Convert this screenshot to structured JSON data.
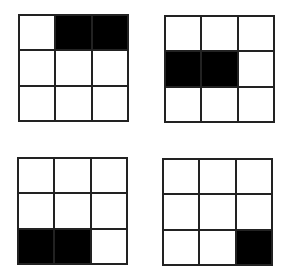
{
  "colors": {
    "filled": "#000000",
    "empty": "#ffffff",
    "line": "#222222"
  },
  "grids": [
    {
      "id": "grid-1",
      "position": "top-left",
      "rows": 3,
      "cols": 3,
      "cells": [
        [
          0,
          1,
          1
        ],
        [
          0,
          0,
          0
        ],
        [
          0,
          0,
          0
        ]
      ]
    },
    {
      "id": "grid-2",
      "position": "top-right",
      "rows": 3,
      "cols": 3,
      "cells": [
        [
          0,
          0,
          0
        ],
        [
          1,
          1,
          0
        ],
        [
          0,
          0,
          0
        ]
      ]
    },
    {
      "id": "grid-3",
      "position": "bottom-left",
      "rows": 3,
      "cols": 3,
      "cells": [
        [
          0,
          0,
          0
        ],
        [
          0,
          0,
          0
        ],
        [
          1,
          1,
          0
        ]
      ]
    },
    {
      "id": "grid-4",
      "position": "bottom-right",
      "rows": 3,
      "cols": 3,
      "cells": [
        [
          0,
          0,
          0
        ],
        [
          0,
          0,
          0
        ],
        [
          0,
          0,
          1
        ]
      ]
    }
  ]
}
